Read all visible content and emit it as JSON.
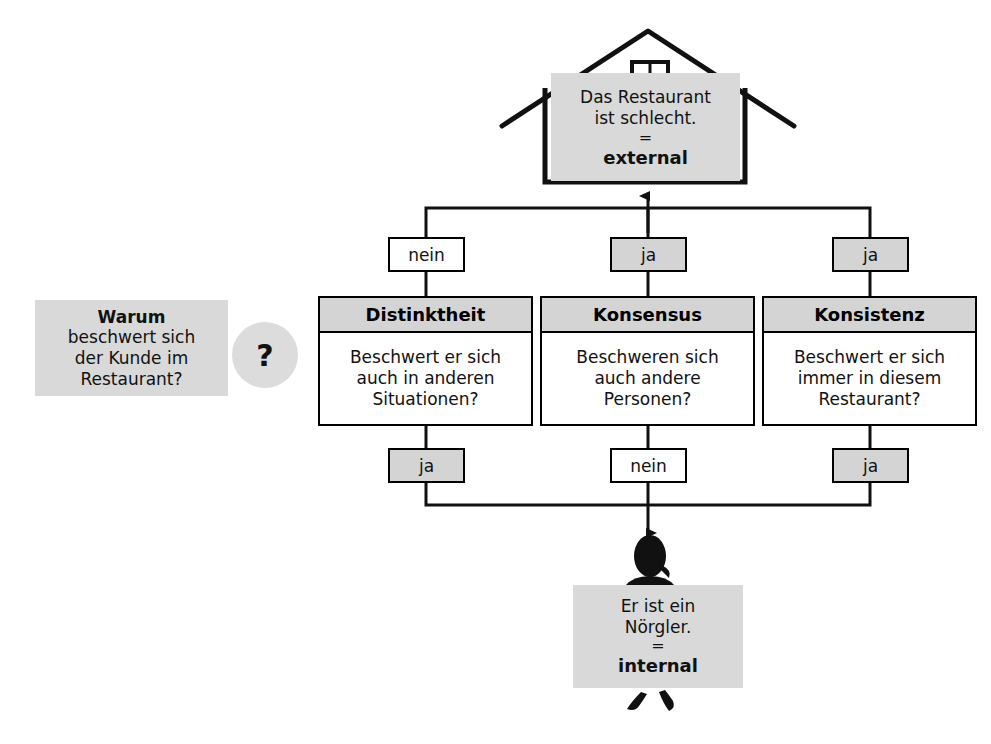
{
  "question_panel": {
    "emphasis": "Warum",
    "line2": "beschwert sich",
    "line3": "der Kunde im",
    "line4": "Restaurant?"
  },
  "question_bubble": {
    "label": "?"
  },
  "external_panel": {
    "line1": "Das Restaurant",
    "line2": "ist schlecht.",
    "equals": "=",
    "attribution": "external"
  },
  "internal_panel": {
    "line1": "Er ist ein",
    "line2": "Nörgler.",
    "equals": "=",
    "attribution": "internal"
  },
  "criteria": [
    {
      "title": "Distinktheit",
      "q_line1": "Beschwert er sich",
      "q_line2": "auch in anderen",
      "q_line3": "Situationen?",
      "answer_top": "nein",
      "answer_top_style": "hollow",
      "answer_bottom": "ja",
      "answer_bottom_style": "filled"
    },
    {
      "title": "Konsensus",
      "q_line1": "Beschweren sich",
      "q_line2": "auch andere",
      "q_line3": "Personen?",
      "answer_top": "ja",
      "answer_top_style": "filled",
      "answer_bottom": "nein",
      "answer_bottom_style": "hollow"
    },
    {
      "title": "Konsistenz",
      "q_line1": "Beschwert er sich",
      "q_line2": "immer in diesem",
      "q_line3": "Restaurant?",
      "answer_top": "ja",
      "answer_top_style": "filled",
      "answer_bottom": "ja",
      "answer_bottom_style": "filled"
    }
  ],
  "icons": {
    "house": "house-icon",
    "person": "person-icon"
  },
  "colors": {
    "fill_gray": "#d9d9d9",
    "header_gray": "#d4d4d4",
    "stroke": "#000000",
    "text": "#111111"
  }
}
